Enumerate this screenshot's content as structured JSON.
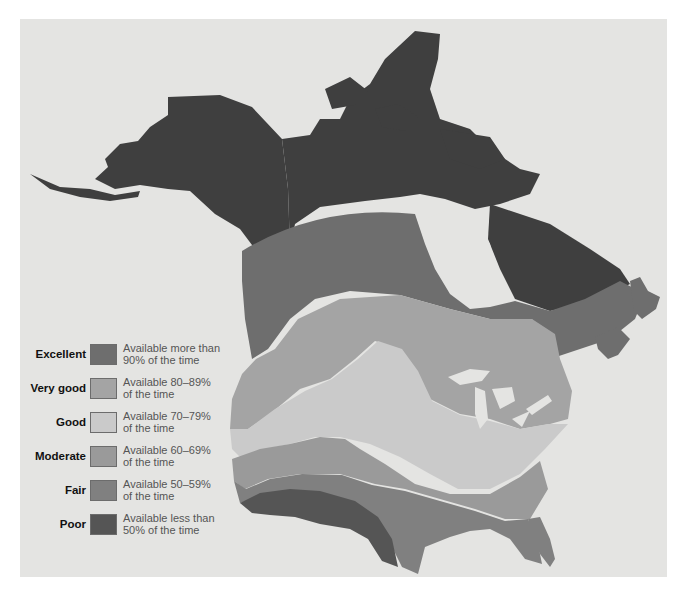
{
  "colors": {
    "background": "#e4e4e2",
    "unrated_land": "#3f3f3f",
    "water": "#e4e4e2",
    "excellent": "#6e6e6e",
    "very_good": "#a4a4a4",
    "good": "#cacaca",
    "moderate": "#9a9a9a",
    "fair": "#808080",
    "poor": "#555555"
  },
  "legend": {
    "items": [
      {
        "label": "Excellent",
        "desc_line1": "Available more than",
        "desc_line2": "90% of the time",
        "color": "#6e6e6e"
      },
      {
        "label": "Very good",
        "desc_line1": "Available 80–89%",
        "desc_line2": "of the time",
        "color": "#a4a4a4"
      },
      {
        "label": "Good",
        "desc_line1": "Available 70–79%",
        "desc_line2": "of the time",
        "color": "#cacaca"
      },
      {
        "label": "Moderate",
        "desc_line1": "Available 60–69%",
        "desc_line2": "of the time",
        "color": "#9a9a9a"
      },
      {
        "label": "Fair",
        "desc_line1": "Available 50–59%",
        "desc_line2": "of the time",
        "color": "#808080"
      },
      {
        "label": "Poor",
        "desc_line1": "Available less than",
        "desc_line2": "50% of the time",
        "color": "#555555"
      }
    ]
  },
  "regions": [
    {
      "name": "Northern Canada and Alaska",
      "category": "unrated"
    },
    {
      "name": "Southern Canada band",
      "category": "Excellent"
    },
    {
      "name": "Northern US / Great Lakes band",
      "category": "Very good"
    },
    {
      "name": "Central Plains and Appalachia",
      "category": "Good"
    },
    {
      "name": "Southern US band",
      "category": "Moderate"
    },
    {
      "name": "Gulf and Southeast",
      "category": "Fair"
    },
    {
      "name": "Desert Southwest",
      "category": "Poor"
    }
  ]
}
